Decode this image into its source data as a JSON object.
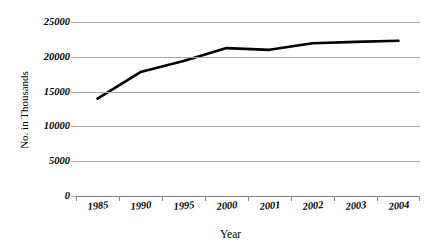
{
  "chart_data": {
    "type": "line",
    "title": "",
    "xlabel": "Year",
    "ylabel": "No. in Thousands",
    "categories": [
      "1985",
      "1990",
      "1995",
      "2000",
      "2001",
      "2002",
      "2003",
      "2004"
    ],
    "values": [
      14000,
      17800,
      19400,
      21250,
      21000,
      21950,
      22150,
      22300
    ],
    "series": [
      {
        "name": "",
        "values": [
          14000,
          17800,
          19400,
          21250,
          21000,
          21950,
          22150,
          22300
        ]
      }
    ],
    "ylim": [
      0,
      25000
    ],
    "yticks": [
      0,
      5000,
      10000,
      15000,
      20000,
      25000
    ],
    "ytick_labels": [
      "0",
      "5000",
      "10000",
      "15000",
      "20000",
      "25000"
    ],
    "grid": true,
    "legend": false,
    "legend_position": "none",
    "line_color": "#000000",
    "grid_color": "#a6a6a6"
  }
}
